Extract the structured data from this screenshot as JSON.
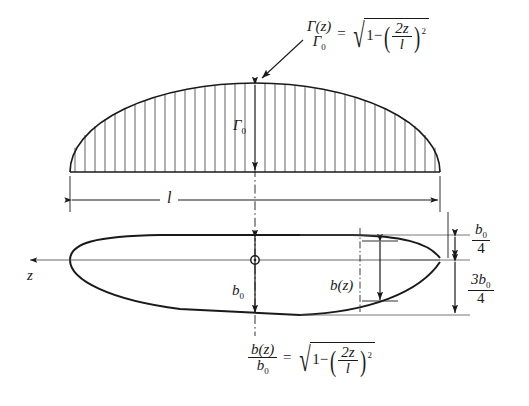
{
  "figure": {
    "background_color": "#ffffff",
    "line_color": "#1a1a1a"
  },
  "formulas": {
    "circulation": {
      "lhs_numerator": "Γ(z)",
      "lhs_denominator": "Γ",
      "lhs_denominator_sub": "0",
      "equals": "=",
      "radicand_lead": "1−",
      "inner_numerator": "2z",
      "inner_denominator": "l",
      "exponent": "2"
    },
    "chord": {
      "lhs_numerator": "b(z)",
      "lhs_denominator": "b",
      "lhs_denominator_sub": "0",
      "equals": "=",
      "radicand_lead": "1−",
      "inner_numerator": "2z",
      "inner_denominator": "l",
      "exponent": "2"
    }
  },
  "labels": {
    "gamma_zero": "Γ",
    "gamma_zero_sub": "0",
    "span": "l",
    "z_axis": "z",
    "b_zero": "b",
    "b_zero_sub": "0",
    "b_of_z": "b(z)",
    "quarter_chord_num": "b",
    "quarter_chord_num_sub": "0",
    "quarter_chord_den": "4",
    "three_quarter_num": "3b",
    "three_quarter_num_sub": "0",
    "three_quarter_den": "4"
  },
  "geometry": {
    "span_left_px": 70,
    "span_right_px": 440,
    "center_x_px": 255,
    "circulation_baseline_y_px": 172,
    "circulation_peak_y_px": 82,
    "planform_axis_y_px": 260,
    "planform_top_y_px": 235,
    "planform_bottom_y_px": 315,
    "hatch_count": 36,
    "bz_station_x_px": 360
  }
}
